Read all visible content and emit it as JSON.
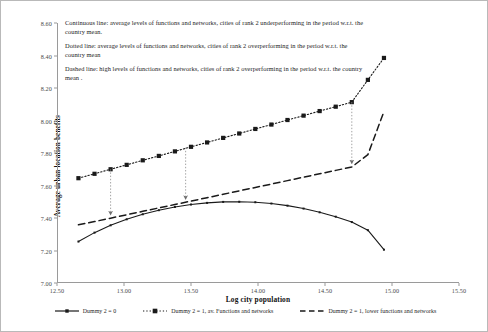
{
  "chart_data": {
    "type": "line",
    "title": "",
    "xlabel": "Log city population",
    "ylabel": "Average urban location benefits",
    "xlim": [
      12.5,
      15.5
    ],
    "ylim": [
      7.0,
      8.6
    ],
    "xticks": [
      "12.50",
      "13.00",
      "13.50",
      "14.00",
      "14.50",
      "15.00",
      "15.50"
    ],
    "yticks": [
      "7.00",
      "7.20",
      "7.40",
      "7.60",
      "7.80",
      "8.00",
      "8.20",
      "8.40",
      "8.60"
    ],
    "grid": false,
    "legend_position": "bottom",
    "series": [
      {
        "name": "Dummy 2 = 0",
        "style": "solid",
        "marker": "small-square",
        "color": "#1a1a1a",
        "x": [
          12.66,
          12.78,
          12.9,
          13.02,
          13.14,
          13.26,
          13.38,
          13.5,
          13.62,
          13.74,
          13.86,
          13.98,
          14.1,
          14.22,
          14.34,
          14.46,
          14.58,
          14.7,
          14.82,
          14.94
        ],
        "y": [
          7.255,
          7.31,
          7.355,
          7.392,
          7.423,
          7.448,
          7.468,
          7.483,
          7.493,
          7.499,
          7.5,
          7.497,
          7.489,
          7.476,
          7.458,
          7.435,
          7.408,
          7.375,
          7.325,
          7.205
        ]
      },
      {
        "name": "Dummy 2 = 1, av. Functions and networks",
        "style": "dotted",
        "marker": "square",
        "color": "#1a1a1a",
        "x": [
          12.66,
          12.78,
          12.9,
          13.02,
          13.14,
          13.26,
          13.38,
          13.5,
          13.62,
          13.74,
          13.86,
          13.98,
          14.1,
          14.22,
          14.34,
          14.46,
          14.58,
          14.7,
          14.82,
          14.94
        ],
        "y": [
          7.645,
          7.672,
          7.7,
          7.727,
          7.755,
          7.782,
          7.81,
          7.838,
          7.865,
          7.893,
          7.92,
          7.948,
          7.975,
          8.003,
          8.03,
          8.058,
          8.085,
          8.113,
          8.25,
          8.385
        ]
      },
      {
        "name": "Dummy 2 = 1, lower functions and networks",
        "style": "dashed",
        "marker": "none",
        "color": "#1a1a1a",
        "x": [
          12.66,
          12.78,
          12.9,
          13.02,
          13.14,
          13.26,
          13.38,
          13.5,
          13.62,
          13.74,
          13.86,
          13.98,
          14.1,
          14.22,
          14.34,
          14.46,
          14.58,
          14.7,
          14.82,
          14.94
        ],
        "y": [
          7.358,
          7.378,
          7.399,
          7.42,
          7.441,
          7.462,
          7.483,
          7.504,
          7.525,
          7.546,
          7.567,
          7.588,
          7.609,
          7.63,
          7.651,
          7.672,
          7.693,
          7.714,
          7.79,
          8.055
        ]
      }
    ],
    "arrows": [
      {
        "x": 12.9,
        "y_from": 7.7,
        "y_to": 7.399,
        "style": "dotted-down-arrow"
      },
      {
        "x": 13.46,
        "y_from": 7.833,
        "y_to": 7.495,
        "style": "dotted-down-arrow"
      },
      {
        "x": 14.7,
        "y_from": 8.113,
        "y_to": 7.714,
        "style": "dotted-down-arrow"
      }
    ]
  },
  "annotations": [
    "Continuous line: average levels of functions and networks, cities of rank 2 underperforming in the period w.r.t. the country mean.",
    "Dotted line:  average levels of functions and networks, cities of rank 2 overperforming in the period w.r.t. the country mean",
    "Dashed line: high levels of functions and networks, cities of rank 2 overperforming in the period w.r.t. the country mean ."
  ]
}
